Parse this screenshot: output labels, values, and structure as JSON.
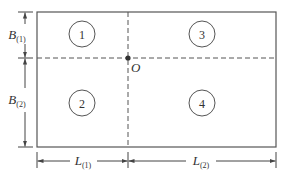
{
  "diagram": {
    "type": "footing-plan-quadrants",
    "colors": {
      "stroke": "#555555",
      "text": "#333333",
      "background": "#ffffff"
    },
    "rectangle": {
      "x": 37,
      "y": 12,
      "width": 239,
      "height": 135
    },
    "origin": {
      "label": "O",
      "x": 128,
      "y": 58
    },
    "regions": [
      {
        "id": 1,
        "label": "1",
        "cx": 82,
        "cy": 34
      },
      {
        "id": 3,
        "label": "3",
        "cx": 202,
        "cy": 34
      },
      {
        "id": 2,
        "label": "2",
        "cx": 82,
        "cy": 103
      },
      {
        "id": 4,
        "label": "4",
        "cx": 202,
        "cy": 103
      }
    ],
    "dimensions": {
      "B1": {
        "main": "B",
        "sub": "(1)"
      },
      "B2": {
        "main": "B",
        "sub": "(2)"
      },
      "L1": {
        "main": "L",
        "sub": "(1)"
      },
      "L2": {
        "main": "L",
        "sub": "(2)"
      }
    }
  }
}
